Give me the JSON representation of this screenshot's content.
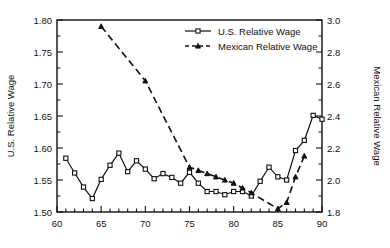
{
  "chart_data": {
    "type": "line",
    "title": "",
    "xlabel": "",
    "ylabel": "U.S. Relative Wage",
    "y2label": "Mexican Relative Wage",
    "xlim": [
      60,
      90
    ],
    "ylim": [
      1.5,
      1.8
    ],
    "y2lim": [
      1.8,
      3.0
    ],
    "xticks": [
      60,
      65,
      70,
      75,
      80,
      85,
      90
    ],
    "xticklabels": [
      "60",
      "65",
      "70",
      "75",
      "80",
      "85",
      "90"
    ],
    "yticks": [
      1.5,
      1.55,
      1.6,
      1.65,
      1.7,
      1.75,
      1.8
    ],
    "yticklabels": [
      "1.50",
      "1.55",
      "1.60",
      "1.65",
      "1.70",
      "1.75",
      "1.80"
    ],
    "y2ticks": [
      1.8,
      2.0,
      2.2,
      2.4,
      2.6,
      2.8,
      3.0
    ],
    "y2ticklabels": [
      "1.8",
      "2.0",
      "2.2",
      "2.4",
      "2.6",
      "2.8",
      "3.0"
    ],
    "minor_xticks": true,
    "grid": false,
    "legend_position": "top-center",
    "series": [
      {
        "name": "U.S. Relative Wage",
        "axis": "left",
        "marker": "square",
        "linestyle": "solid",
        "color": "#111111",
        "x": [
          61,
          62,
          63,
          64,
          65,
          66,
          67,
          68,
          69,
          70,
          71,
          72,
          73,
          74,
          75,
          76,
          77,
          78,
          79,
          80,
          81,
          82,
          83,
          84,
          85,
          86,
          87,
          88,
          89,
          90
        ],
        "values": [
          1.584,
          1.561,
          1.539,
          1.521,
          1.551,
          1.573,
          1.592,
          1.563,
          1.58,
          1.567,
          1.552,
          1.56,
          1.554,
          1.545,
          1.562,
          1.545,
          1.532,
          1.532,
          1.527,
          1.532,
          1.532,
          1.525,
          1.548,
          1.57,
          1.555,
          1.55,
          1.596,
          1.612,
          1.651,
          1.645
        ]
      },
      {
        "name": "Mexican Relative Wage",
        "axis": "right",
        "marker": "triangle",
        "linestyle": "dashed",
        "color": "#111111",
        "x": [
          65,
          70,
          75,
          76,
          77,
          78,
          79,
          80,
          81,
          82,
          85,
          86,
          87,
          88
        ],
        "values": [
          2.96,
          2.62,
          2.08,
          2.06,
          2.04,
          2.02,
          2.0,
          1.98,
          1.95,
          1.92,
          1.82,
          1.86,
          2.02,
          2.15
        ]
      }
    ],
    "legend": [
      {
        "label": "U.S. Relative Wage",
        "marker": "square",
        "linestyle": "solid"
      },
      {
        "label": "Mexican Relative Wage",
        "marker": "triangle",
        "linestyle": "dashed"
      }
    ]
  }
}
